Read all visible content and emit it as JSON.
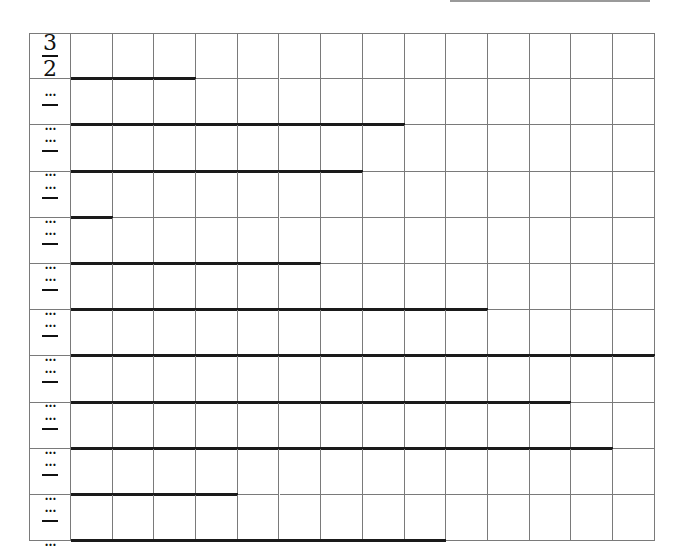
{
  "top_line": {
    "color": "#9a9a9a"
  },
  "grid": {
    "columns": 14,
    "rows": 11,
    "label_col_width": 42,
    "col_width": 41.7,
    "row_height": 46.2,
    "line_color": "#7a7a7a"
  },
  "row_labels": [
    {
      "numerator": "3",
      "denominator": "2"
    },
    {
      "numerator": "…",
      "denominator": "…"
    },
    {
      "numerator": "…",
      "denominator": "…"
    },
    {
      "numerator": "…",
      "denominator": "…"
    },
    {
      "numerator": "…",
      "denominator": "…"
    },
    {
      "numerator": "…",
      "denominator": "…"
    },
    {
      "numerator": "…",
      "denominator": "…"
    },
    {
      "numerator": "…",
      "denominator": "…"
    },
    {
      "numerator": "…",
      "denominator": "…"
    },
    {
      "numerator": "…",
      "denominator": "…"
    },
    {
      "numerator": "…",
      "denominator": "…"
    }
  ],
  "bars": {
    "color": "#1a1a1a",
    "lengths_in_columns": [
      3,
      8,
      7,
      1,
      6,
      10,
      14,
      12,
      13,
      4,
      9
    ]
  }
}
